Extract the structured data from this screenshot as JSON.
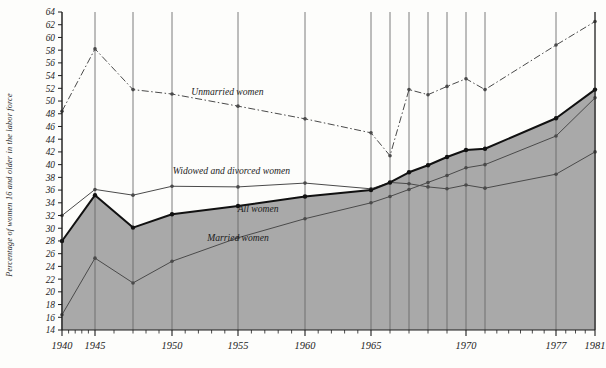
{
  "chart_data": {
    "type": "line",
    "title": "",
    "xlabel": "",
    "ylabel": "Percentage of women 16 and older in the labor force",
    "ylim": [
      14,
      64
    ],
    "ytick_step": 2,
    "yticks": [
      14,
      16,
      18,
      20,
      22,
      24,
      26,
      28,
      30,
      32,
      34,
      36,
      38,
      40,
      42,
      44,
      46,
      48,
      50,
      52,
      54,
      56,
      58,
      60,
      62,
      64
    ],
    "xticks": [
      1940,
      1945,
      1950,
      1955,
      1960,
      1965,
      1970,
      1977,
      1981
    ],
    "xtick_labels": [
      "1940",
      "1945",
      "1950",
      "1955",
      "1960",
      "1965",
      "1970",
      "1977",
      "1981"
    ],
    "grid": "vertical-only",
    "legend": "inline-annotations",
    "x": [
      1940,
      1945,
      1947,
      1950,
      1955,
      1960,
      1965,
      1966,
      1967,
      1968,
      1969,
      1970,
      1971,
      1977,
      1981
    ],
    "series": [
      {
        "name": "Unmarried women",
        "style": "dash-dot",
        "values": [
          48.4,
          58.2,
          51.8,
          51.1,
          49.2,
          47.2,
          45.0,
          41.4,
          51.8,
          51.0,
          52.3,
          53.5,
          51.8,
          58.8,
          62.5
        ]
      },
      {
        "name": "Widowed and divorced women",
        "style": "solid-thin",
        "values": [
          32.0,
          36.1,
          35.2,
          36.6,
          36.5,
          37.1,
          36.2,
          37.2,
          37.0,
          36.5,
          36.2,
          36.8,
          36.3,
          38.5,
          42.0
        ]
      },
      {
        "name": "All women",
        "style": "solid-thick",
        "values": [
          28.0,
          35.2,
          30.1,
          32.2,
          33.5,
          35.0,
          36.0,
          37.2,
          38.8,
          39.9,
          41.2,
          42.3,
          42.5,
          47.3,
          51.8
        ]
      },
      {
        "name": "Married women",
        "style": "solid-thin",
        "values": [
          16.4,
          25.3,
          21.4,
          24.8,
          28.5,
          31.5,
          34.0,
          35.0,
          36.1,
          37.2,
          38.3,
          39.5,
          40.0,
          44.5,
          50.5
        ]
      }
    ],
    "annotations": [
      {
        "text": "Unmarried women",
        "x": 1954.2,
        "y": 51.0
      },
      {
        "text": "Widowed and divorced women",
        "x": 1954.5,
        "y": 38.6
      },
      {
        "text": "All women",
        "x": 1956.5,
        "y": 32.6
      },
      {
        "text": "Married women",
        "x": 1955.0,
        "y": 28.0
      }
    ],
    "shaded_region": {
      "under_series": "All women",
      "color": "#a8a8a8",
      "description": "gray fill between the All women curve and the x-axis baseline"
    },
    "colors": {
      "shade": "#a9a9a9",
      "all_women_line": "#111111",
      "other_lines": "#4a4a4a",
      "grid": "#6e6e6e",
      "axis": "#1c1c1c",
      "background": "#fdfdfb"
    }
  }
}
